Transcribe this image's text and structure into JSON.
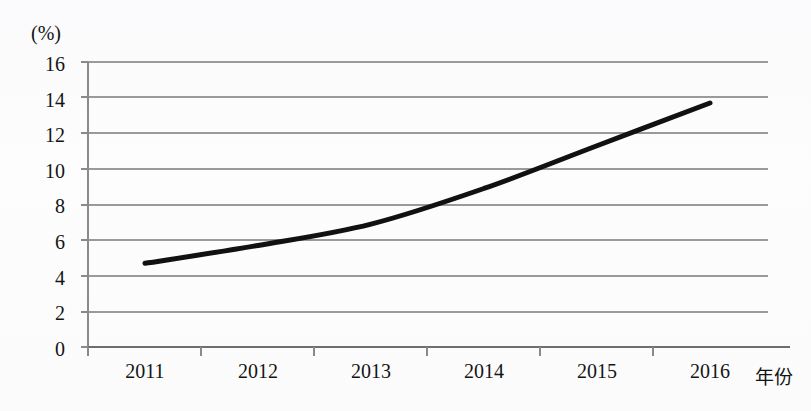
{
  "chart_data": {
    "type": "line",
    "title": "",
    "subtitle": "",
    "xlabel": "年份",
    "ylabel": "(%)",
    "categories": [
      "2011",
      "2012",
      "2013",
      "2014",
      "2015",
      "2016"
    ],
    "x": [
      2011,
      2012,
      2013,
      2014,
      2015,
      2016
    ],
    "values": [
      4.7,
      5.7,
      6.9,
      8.9,
      11.3,
      13.7
    ],
    "series": [
      {
        "name": "",
        "values": [
          4.7,
          5.7,
          6.9,
          8.9,
          11.3,
          13.7
        ]
      }
    ],
    "ylim": [
      0,
      16
    ],
    "y_ticks": [
      0,
      2,
      4,
      6,
      8,
      10,
      12,
      14,
      16
    ],
    "y_tick_labels": [
      "0",
      "2",
      "4",
      "6",
      "8",
      "10",
      "12",
      "14",
      "16"
    ],
    "x_tick_labels": [
      "2011",
      "2012",
      "2013",
      "2014",
      "2015",
      "2016"
    ],
    "grid": true,
    "grid_axis": "y",
    "legend": false,
    "legend_position": "none",
    "line_color": "#111111",
    "line_width": 5,
    "grid_color": "#9a9a9a",
    "axis_color": "#6e6e6e",
    "background_color": "#fdfdfd",
    "annotations": []
  },
  "axes": {
    "y_unit": "(%)",
    "x_title": "年份"
  }
}
